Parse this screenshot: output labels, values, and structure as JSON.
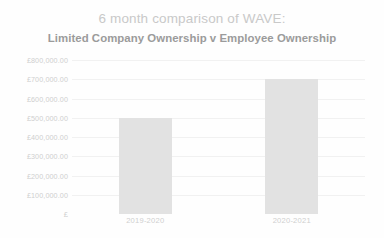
{
  "chart_data": {
    "type": "bar",
    "title": "6 month comparison of WAVE:",
    "subtitle": "Limited Company Ownership v Employee Ownership",
    "categories": [
      "2019-2020",
      "2020-2021"
    ],
    "values": [
      500000,
      700000
    ],
    "series": [
      {
        "name": "WAVE",
        "values": [
          500000,
          700000
        ]
      }
    ],
    "xlabel": "",
    "ylabel": "",
    "ylim": [
      0,
      800000
    ],
    "ytick_values": [
      800000,
      700000,
      600000,
      500000,
      400000,
      300000,
      200000,
      100000,
      0
    ],
    "ytick_labels": [
      "£800,000.00",
      "£700,000.00",
      "£600,000.00",
      "£500,000.00",
      "£400,000.00",
      "£300,000.00",
      "£200,000.00",
      "£100,000.00",
      "£"
    ],
    "currency_symbol": "£",
    "grid": true,
    "legend": false,
    "legend_position": "none",
    "colors": {
      "bar_fill": "#e2e2e2",
      "gridline": "#f1f1f1",
      "title_text": "#c9c9c9",
      "subtitle_text": "#9b9b9b",
      "tick_text": "#cfcfcf",
      "background": "#fefefe"
    }
  }
}
